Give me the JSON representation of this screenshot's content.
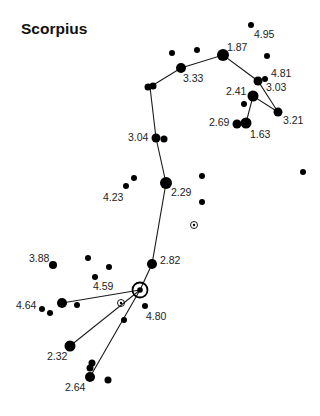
{
  "title": "Scorpius",
  "colors": {
    "star": "#000000",
    "line": "#1a1a1a",
    "label": "#222222",
    "background": "#ffffff"
  },
  "stars": [
    {
      "id": "s495",
      "x": 251,
      "y": 25,
      "r": 3,
      "label": "4.95",
      "lx": 254,
      "ly": 38
    },
    {
      "id": "s187",
      "x": 223,
      "y": 55,
      "r": 6,
      "label": "1.87",
      "lx": 227,
      "ly": 51
    },
    {
      "id": "a1",
      "x": 172,
      "y": 53,
      "r": 3
    },
    {
      "id": "a2",
      "x": 197,
      "y": 50,
      "r": 3
    },
    {
      "id": "s333",
      "x": 181,
      "y": 68,
      "r": 5,
      "label": "3.33",
      "lx": 183,
      "ly": 82
    },
    {
      "id": "a3",
      "x": 267,
      "y": 56,
      "r": 3
    },
    {
      "id": "s481",
      "x": 265,
      "y": 79,
      "r": 3,
      "label": "4.81",
      "lx": 271,
      "ly": 77
    },
    {
      "id": "s303",
      "x": 258,
      "y": 81,
      "r": 4.5,
      "label": "3.03",
      "lx": 266,
      "ly": 91
    },
    {
      "id": "s241",
      "x": 253,
      "y": 96,
      "r": 5.5,
      "label": "2.41",
      "lx": 226,
      "ly": 95
    },
    {
      "id": "a4",
      "x": 244,
      "y": 104,
      "r": 3
    },
    {
      "id": "s321",
      "x": 278,
      "y": 112,
      "r": 4.5,
      "label": "3.21",
      "lx": 283,
      "ly": 124
    },
    {
      "id": "s269",
      "x": 237,
      "y": 124,
      "r": 4.5,
      "label": "2.69",
      "lx": 209,
      "ly": 126
    },
    {
      "id": "s163",
      "x": 246,
      "y": 123,
      "r": 5.5,
      "label": "1.63",
      "lx": 250,
      "ly": 138
    },
    {
      "id": "b1",
      "x": 148,
      "y": 87,
      "r": 3.5
    },
    {
      "id": "b2",
      "x": 153,
      "y": 86,
      "r": 3.5
    },
    {
      "id": "s304",
      "x": 156,
      "y": 138,
      "r": 4.5,
      "label": "3.04",
      "lx": 128,
      "ly": 141
    },
    {
      "id": "b3",
      "x": 164,
      "y": 139,
      "r": 3.5
    },
    {
      "id": "s229",
      "x": 166,
      "y": 183,
      "r": 6,
      "label": "2.29",
      "lx": 171,
      "ly": 196
    },
    {
      "id": "s423",
      "x": 126,
      "y": 186,
      "r": 3,
      "label": "4.23",
      "lx": 103,
      "ly": 201
    },
    {
      "id": "c1",
      "x": 134,
      "y": 178,
      "r": 3
    },
    {
      "id": "c2",
      "x": 202,
      "y": 176,
      "r": 3
    },
    {
      "id": "c3",
      "x": 202,
      "y": 202,
      "r": 3
    },
    {
      "id": "c4",
      "x": 303,
      "y": 172,
      "r": 3
    },
    {
      "id": "s282",
      "x": 152,
      "y": 264,
      "r": 5,
      "label": "2.82",
      "lx": 160,
      "ly": 264
    },
    {
      "id": "s388",
      "x": 53,
      "y": 265,
      "r": 4,
      "label": "3.88",
      "lx": 29,
      "ly": 262
    },
    {
      "id": "d1",
      "x": 88,
      "y": 258,
      "r": 3
    },
    {
      "id": "d2",
      "x": 109,
      "y": 267,
      "r": 3
    },
    {
      "id": "s459",
      "x": 95,
      "y": 277,
      "r": 3,
      "label": "4.59",
      "lx": 93,
      "ly": 290
    },
    {
      "id": "s464",
      "x": 62,
      "y": 303,
      "r": 5,
      "label": "4.64",
      "lx": 16,
      "ly": 309
    },
    {
      "id": "d3",
      "x": 42,
      "y": 309,
      "r": 3
    },
    {
      "id": "d4",
      "x": 50,
      "y": 313,
      "r": 3
    },
    {
      "id": "d5",
      "x": 77,
      "y": 305,
      "r": 3
    },
    {
      "id": "s480",
      "x": 145,
      "y": 306,
      "r": 3,
      "label": "4.80",
      "lx": 146,
      "ly": 320
    },
    {
      "id": "d6",
      "x": 124,
      "y": 320,
      "r": 3
    },
    {
      "id": "s232",
      "x": 70,
      "y": 346,
      "r": 5.5,
      "label": "2.32",
      "lx": 47,
      "ly": 360
    },
    {
      "id": "e1",
      "x": 92,
      "y": 363,
      "r": 3.5
    },
    {
      "id": "e2",
      "x": 90,
      "y": 368,
      "r": 3.5
    },
    {
      "id": "s264",
      "x": 90,
      "y": 377,
      "r": 5,
      "label": "2.64",
      "lx": 65,
      "ly": 391
    },
    {
      "id": "e3",
      "x": 108,
      "y": 380,
      "r": 3.5
    }
  ],
  "targets": [
    {
      "id": "t1",
      "x": 194,
      "y": 225,
      "r": 3.5,
      "size": "small"
    },
    {
      "id": "t2",
      "x": 121,
      "y": 303,
      "r": 3.5,
      "size": "small"
    },
    {
      "id": "t3",
      "x": 140,
      "y": 290,
      "r": 7.5,
      "size": "large"
    }
  ],
  "lines": [
    [
      [
        150,
        87
      ],
      [
        181,
        68
      ],
      [
        223,
        55
      ],
      [
        258,
        81
      ],
      [
        278,
        112
      ],
      [
        253,
        96
      ],
      [
        246,
        123
      ]
    ],
    [
      [
        150,
        87
      ],
      [
        156,
        138
      ],
      [
        166,
        183
      ],
      [
        152,
        264
      ],
      [
        140,
        290
      ]
    ],
    [
      [
        140,
        290
      ],
      [
        62,
        303
      ]
    ],
    [
      [
        140,
        290
      ],
      [
        70,
        346
      ]
    ],
    [
      [
        140,
        290
      ],
      [
        90,
        377
      ]
    ]
  ]
}
